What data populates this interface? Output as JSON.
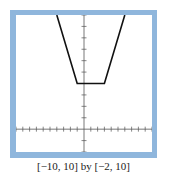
{
  "window": {
    "frame_color": "#8fb6dc",
    "screen_color": "#ffffff",
    "caption": "[−10, 10] by [−2, 10]"
  },
  "chart_data": {
    "type": "line",
    "title": "",
    "xlabel": "",
    "ylabel": "",
    "xlim": [
      -10,
      10
    ],
    "ylim": [
      -2,
      10
    ],
    "xscale": 1,
    "yscale": 1,
    "grid": false,
    "legend": null,
    "series": [
      {
        "name": "y = |x + 1| + |x - 3|",
        "color": "#111111",
        "x": [
          -4,
          -1,
          3,
          6
        ],
        "y": [
          10,
          4,
          4,
          10
        ]
      }
    ],
    "annotations": [
      "[−10, 10] by [−2, 10]"
    ]
  }
}
